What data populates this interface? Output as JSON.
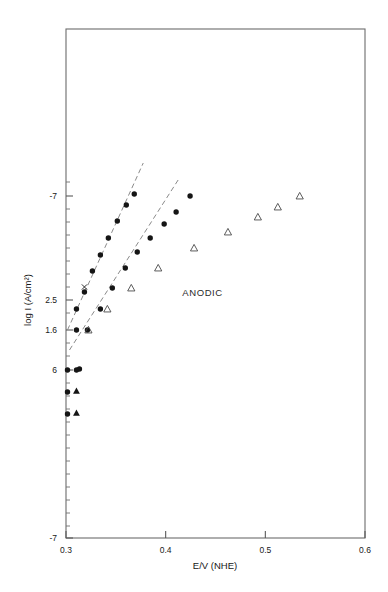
{
  "chart_data": {
    "type": "scatter",
    "title": "",
    "xlabel": "E/V (NHE)",
    "ylabel": "log I (A/cm2)",
    "ylabel_display": "log I (A/cm²)",
    "xlim": [
      0.3,
      0.6
    ],
    "ylim_labels": [
      "-7",
      "2.5",
      "1.6",
      "6",
      "-7"
    ],
    "grid": false,
    "legend": false,
    "annotations": [
      {
        "text": "ANODIC",
        "x": 0.437,
        "y_px": 296
      }
    ],
    "x_ticks": [
      "0.3",
      "0.4",
      "0.5",
      "0.6"
    ],
    "x_tick_values": [
      0.3,
      0.4,
      0.5,
      0.6
    ],
    "y_ticks": [
      {
        "label": "-7",
        "y_px": 196
      },
      {
        "label": "2.5",
        "y_px": 300
      },
      {
        "label": "1.6",
        "y_px": 330
      },
      {
        "label": "6",
        "y_px": 370
      },
      {
        "label": "-7",
        "y_px": 538
      }
    ],
    "y_minor_ticks_px": [
      182,
      209,
      222,
      235,
      248,
      261,
      274,
      287,
      313,
      343,
      356,
      383,
      396,
      409,
      422,
      435,
      448,
      461,
      474,
      487,
      500,
      513,
      526
    ],
    "series": [
      {
        "name": "upper-branch-filled",
        "marker": "filled-circle",
        "points": [
          {
            "x": 0.3105,
            "y_px": 309
          },
          {
            "x": 0.3185,
            "y_px": 292
          },
          {
            "x": 0.3265,
            "y_px": 271
          },
          {
            "x": 0.3345,
            "y_px": 255
          },
          {
            "x": 0.3425,
            "y_px": 238
          },
          {
            "x": 0.3515,
            "y_px": 221
          },
          {
            "x": 0.3605,
            "y_px": 205
          },
          {
            "x": 0.3685,
            "y_px": 194
          }
        ]
      },
      {
        "name": "lower-branch-filled",
        "marker": "filled-circle",
        "points": [
          {
            "x": 0.3105,
            "y_px": 330
          },
          {
            "x": 0.3215,
            "y_px": 330
          },
          {
            "x": 0.3345,
            "y_px": 309
          },
          {
            "x": 0.3465,
            "y_px": 288
          },
          {
            "x": 0.3595,
            "y_px": 268
          },
          {
            "x": 0.3715,
            "y_px": 252
          },
          {
            "x": 0.3845,
            "y_px": 238
          },
          {
            "x": 0.3985,
            "y_px": 224
          },
          {
            "x": 0.4105,
            "y_px": 212
          },
          {
            "x": 0.4245,
            "y_px": 196
          }
        ]
      },
      {
        "name": "open-triangles",
        "marker": "open-triangle",
        "points": [
          {
            "x": 0.3225,
            "y_px": 330
          },
          {
            "x": 0.3415,
            "y_px": 309
          },
          {
            "x": 0.3655,
            "y_px": 288
          },
          {
            "x": 0.3925,
            "y_px": 268
          },
          {
            "x": 0.4285,
            "y_px": 248
          },
          {
            "x": 0.4625,
            "y_px": 232
          },
          {
            "x": 0.4925,
            "y_px": 217
          },
          {
            "x": 0.5125,
            "y_px": 207
          },
          {
            "x": 0.5345,
            "y_px": 196
          }
        ]
      },
      {
        "name": "cross-markers",
        "marker": "cross",
        "points": [
          {
            "x": 0.3185,
            "y_px": 287
          }
        ]
      },
      {
        "name": "low-potential-cluster",
        "marker": "mixed",
        "points": [
          {
            "x": 0.3015,
            "y_px": 370,
            "marker": "filled-circle"
          },
          {
            "x": 0.3105,
            "y_px": 370,
            "marker": "filled-circle"
          },
          {
            "x": 0.3135,
            "y_px": 369,
            "marker": "filled-circle"
          },
          {
            "x": 0.3015,
            "y_px": 392,
            "marker": "filled-circle"
          },
          {
            "x": 0.3105,
            "y_px": 391,
            "marker": "filled-triangle"
          },
          {
            "x": 0.3015,
            "y_px": 414,
            "marker": "filled-circle"
          },
          {
            "x": 0.3105,
            "y_px": 413,
            "marker": "filled-triangle"
          }
        ]
      }
    ],
    "fit_lines": [
      {
        "name": "upper-fit-line",
        "style": "dashed",
        "x1": 0.3015,
        "y1_px": 330,
        "x2": 0.3775,
        "y2_px": 163
      },
      {
        "name": "lower-fit-line",
        "style": "dashed",
        "x1": 0.3035,
        "y1_px": 350,
        "x2": 0.4125,
        "y2_px": 180
      }
    ],
    "plot_box_px": {
      "left": 66,
      "right": 365,
      "top": 29,
      "bottom": 538
    }
  }
}
